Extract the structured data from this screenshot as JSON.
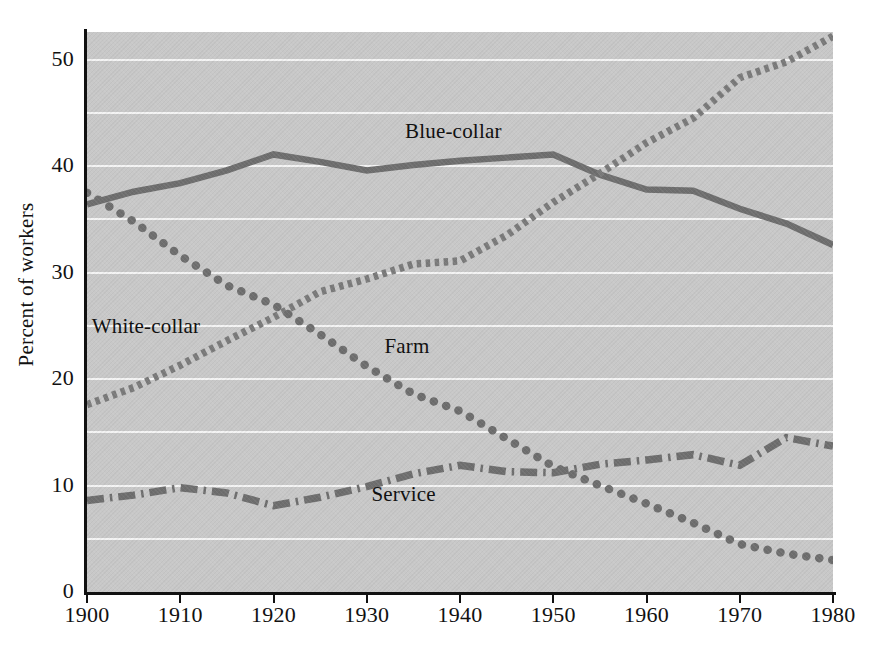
{
  "figure": {
    "ytitle": "Percent of workers",
    "background_color": "#c8c8c8",
    "gridline_color": "#f4f4f4",
    "axis_color": "#111111",
    "series_color": "#6e6e6e"
  },
  "axes": {
    "y_ticks": [
      "50",
      "40",
      "30",
      "20",
      "10",
      "0"
    ],
    "y_tick_values": [
      50,
      40,
      30,
      20,
      10,
      0
    ],
    "x_ticks": [
      "1900",
      "1910",
      "1920",
      "1930",
      "1940",
      "1950",
      "1960",
      "1970",
      "1980"
    ],
    "x_tick_values": [
      1900,
      1910,
      1920,
      1930,
      1940,
      1950,
      1960,
      1970,
      1980
    ],
    "gridline_values": [
      5,
      10,
      15,
      20,
      25,
      30,
      35,
      40,
      45,
      50
    ]
  },
  "annotations": [
    {
      "name": "blue-collar",
      "text": "Blue-collar",
      "x": 1934.1,
      "y": 43.2
    },
    {
      "name": "white-collar",
      "text": "White-collar",
      "x": 1900.5,
      "y": 24.9
    },
    {
      "name": "farm",
      "text": "Farm",
      "x": 1931.9,
      "y": 23.0
    },
    {
      "name": "service",
      "text": "Service",
      "x": 1930.5,
      "y": 9.1
    }
  ],
  "chart_data": {
    "type": "line",
    "title": "",
    "xlabel": "",
    "ylabel": "Percent of workers",
    "xlim": [
      1900,
      1980
    ],
    "ylim": [
      0,
      52.6
    ],
    "grid": true,
    "legend": "inline-annotations",
    "x": [
      1900,
      1905,
      1910,
      1915,
      1920,
      1925,
      1930,
      1935,
      1940,
      1945,
      1950,
      1955,
      1960,
      1965,
      1970,
      1975,
      1980
    ],
    "series": [
      {
        "name": "Blue-collar",
        "style": "solid",
        "color": "#6e6e6e",
        "values": [
          36.4,
          37.6,
          38.4,
          39.6,
          41.1,
          40.4,
          39.6,
          40.1,
          40.5,
          40.8,
          41.1,
          39.2,
          37.8,
          37.7,
          36.0,
          34.6,
          32.6
        ]
      },
      {
        "name": "White-collar",
        "style": "dashed",
        "color": "#7a7a7a",
        "values": [
          17.6,
          19.2,
          21.3,
          23.6,
          25.8,
          28.2,
          29.4,
          30.8,
          31.1,
          33.5,
          36.6,
          39.3,
          42.2,
          44.5,
          48.3,
          49.8,
          52.2
        ]
      },
      {
        "name": "Farm",
        "style": "dotted",
        "color": "#6e6e6e",
        "values": [
          37.5,
          34.8,
          31.6,
          28.8,
          27.0,
          24.2,
          21.2,
          18.6,
          17.0,
          14.4,
          11.8,
          10.0,
          8.3,
          6.5,
          4.5,
          3.6,
          3.0
        ]
      },
      {
        "name": "Service",
        "style": "dash-dot",
        "color": "#6e6e6e",
        "values": [
          8.6,
          9.1,
          9.8,
          9.3,
          8.1,
          8.9,
          9.9,
          11.1,
          11.9,
          11.3,
          11.2,
          12.0,
          12.4,
          12.9,
          11.9,
          14.5,
          13.7
        ]
      }
    ]
  }
}
